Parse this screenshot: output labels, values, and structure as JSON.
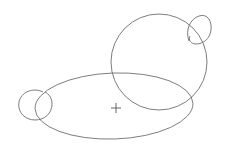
{
  "canvas": {
    "width": 226,
    "height": 150,
    "background_color": "#ffffff",
    "stroke_color": "#6e6e6e",
    "marker_color": "#555555",
    "stroke_width": 0.9,
    "title": "Line Drawing"
  },
  "chart_data": {
    "type": "scatter",
    "title": "",
    "subtitle": "",
    "xlabel": "",
    "ylabel": "",
    "grid": false,
    "legend": "none",
    "xlim": [
      0,
      226
    ],
    "ylim": [
      0,
      150
    ],
    "shapes": [
      {
        "name": "body-ellipse",
        "type": "ellipse",
        "cx": 114,
        "cy": 106,
        "rx": 79,
        "ry": 33,
        "rotation": -2
      },
      {
        "name": "head-circle",
        "type": "circle",
        "cx": 159,
        "cy": 62,
        "r": 48
      },
      {
        "name": "ear-teardrop",
        "type": "path",
        "d": "M 189 41 C 185 30 190 19 199 16 C 208 13 212 22 211 30 C 210 39 203 44 196 44 C 191 44 188 40 190 36",
        "anchor_x": 200,
        "anchor_y": 30
      },
      {
        "name": "foot-loop",
        "type": "path",
        "d": "M 43 92 C 33 87 21 92 19 102 C 17 112 25 120 35 120 C 45 120 52 113 52 104 C 52 98 49 94 45 92",
        "anchor_x": 35,
        "anchor_y": 105
      }
    ],
    "markers": [
      {
        "name": "center-cross",
        "type": "cross",
        "x": 116,
        "y": 108,
        "size": 5
      }
    ]
  }
}
